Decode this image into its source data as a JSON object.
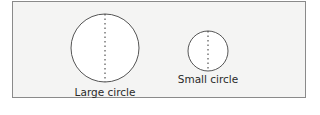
{
  "diagram": {
    "shapes": [
      {
        "name": "large-circle",
        "label": "Large circle",
        "cx": 105,
        "cy": 48,
        "r": 34
      },
      {
        "name": "small-circle",
        "label": "Small circle",
        "cx": 208,
        "cy": 51,
        "r": 20
      }
    ],
    "colors": {
      "background": "#f4f4f3",
      "stroke": "#555555",
      "fill": "#ffffff"
    }
  }
}
